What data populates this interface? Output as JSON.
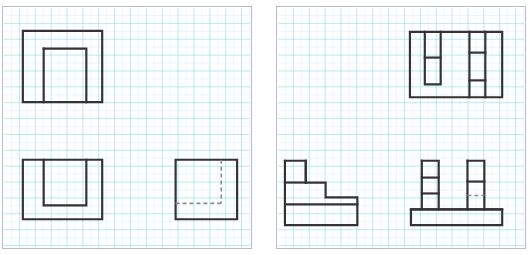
{
  "document": {
    "title": "Orthographic Multiview Projection Worksheet",
    "sheet_type": "graph-paper",
    "panel_count": 2
  },
  "style": {
    "grid_minor_color": "#d8f0f3",
    "grid_major_color": "#7fd4e0",
    "object_line_color": "#333333",
    "hidden_line_color": "#8a8a8a",
    "panel_border_color": "#b9bcc0",
    "background_color": "#ffffff",
    "object_line_width": 2.2,
    "hidden_line_width": 1.6,
    "hidden_line_dash": "4,3"
  },
  "layout": {
    "canvas_width": 530,
    "canvas_height": 255,
    "panel_width": 250,
    "panel_height": 243,
    "panel_top": 6,
    "panel_left_x": 2,
    "panel_right_x": 278,
    "grid_minor_step": 8,
    "grid_major_step": 16
  },
  "chart_data": {
    "type": "diagram",
    "grid": true,
    "panels": [
      {
        "id": "panel-left",
        "label": "Problem 1",
        "views": [
          {
            "id": "view-top-left-1",
            "name": "top-view",
            "position": "upper-left",
            "description": "Square outline with an inverted U slot opening downward",
            "bbox": [
              22,
              30,
              80,
              72
            ],
            "solid_paths": [
              "M 22 30 L 102 30 L 102 102 L 22 102 Z",
              "M 43 48 L 86 48 L 86 102",
              "M 43 48 L 43 102"
            ],
            "hidden_paths": []
          },
          {
            "id": "view-front-left-1",
            "name": "front-view",
            "position": "lower-left",
            "description": "Square outline with a U shaped pocket opening upward",
            "bbox": [
              22,
              160,
              80,
              60
            ],
            "solid_paths": [
              "M 22 160 L 102 160 L 102 220 L 22 220 Z",
              "M 43 160 L 43 206 L 86 206 L 86 160"
            ],
            "hidden_paths": []
          },
          {
            "id": "view-side-left-1",
            "name": "side-view",
            "position": "lower-right",
            "description": "Square outline with dashed hidden L corner at lower right",
            "bbox": [
              176,
              160,
              62,
              60
            ],
            "solid_paths": [
              "M 176 160 L 238 160 L 238 220 L 176 220 Z"
            ],
            "hidden_paths": [
              "M 222 160 L 222 204",
              "M 222 204 L 176 204"
            ]
          }
        ]
      },
      {
        "id": "panel-right",
        "label": "Problem 2",
        "views": [
          {
            "id": "view-top-right-2",
            "name": "top-view",
            "position": "upper-right",
            "description": "Rectangle with two vertical slot columns each divided into cells",
            "bbox": [
              412,
              31,
              93,
              66
            ],
            "solid_paths": [
              "M 412 31 L 505 31 L 505 97 L 412 97 Z",
              "M 427 31 L 427 84 L 443 84 L 443 31",
              "M 427 57 L 443 57",
              "M 472 31 L 472 97",
              "M 488 31 L 488 97",
              "M 472 52 L 488 52",
              "M 472 80 L 488 80"
            ],
            "hidden_paths": []
          },
          {
            "id": "view-front-right-2",
            "name": "front-view",
            "position": "lower-left",
            "description": "Stepped staircase profile on a base plate",
            "bbox": [
              286,
              161,
              73,
              65
            ],
            "solid_paths": [
              "M 286 161 L 286 226 L 359 226 L 359 205 L 286 205",
              "M 286 161 L 307 161 L 307 183 L 327 183 L 327 198 L 359 198 L 359 205",
              "M 307 161 L 307 183",
              "M 286 183 L 307 183"
            ],
            "hidden_paths": []
          },
          {
            "id": "view-side-right-2",
            "name": "side-view",
            "position": "lower-right",
            "description": "Two vertical legs with segment divisions standing on a wide base plate",
            "bbox": [
              413,
              161,
              92,
              65
            ],
            "solid_paths": [
              "M 413 210 L 413 226 L 505 226 L 505 210 Z",
              "M 424 161 L 441 161 L 441 210",
              "M 424 161 L 424 210",
              "M 424 178 L 441 178",
              "M 424 194 L 441 194",
              "M 470 161 L 487 161 L 487 210",
              "M 470 161 L 470 210",
              "M 470 182 L 487 182",
              "M 413 210 L 505 210"
            ],
            "hidden_paths": [
              "M 470 196 L 487 196"
            ]
          }
        ]
      }
    ]
  }
}
